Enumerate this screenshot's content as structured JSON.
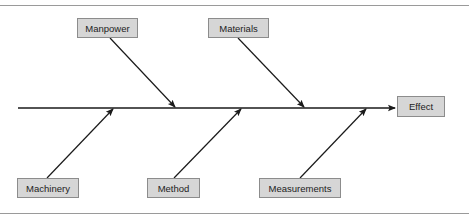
{
  "diagram": {
    "type": "fishbone",
    "effect": {
      "label": "Effect"
    },
    "causes": {
      "manpower": {
        "label": "Manpower",
        "side": "top"
      },
      "materials": {
        "label": "Materials",
        "side": "top"
      },
      "machinery": {
        "label": "Machinery",
        "side": "bottom"
      },
      "method": {
        "label": "Method",
        "side": "bottom"
      },
      "measurements": {
        "label": "Measurements",
        "side": "bottom"
      }
    },
    "colors": {
      "line": "#1a1a1a",
      "box_fill": "#d6d6d6",
      "box_border": "#8c8c8c",
      "frame": "#9a9a9a"
    }
  }
}
